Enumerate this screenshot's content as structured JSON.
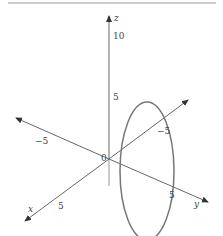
{
  "figure": {
    "type": "3d-axes-with-ellipse",
    "axes": {
      "z": {
        "label": "z",
        "ticks": [
          "10",
          "5"
        ]
      },
      "x": {
        "label": "x",
        "ticks": [
          "5",
          "−5"
        ]
      },
      "y": {
        "label": "y",
        "ticks": [
          "5",
          "−5"
        ]
      },
      "origin_label": "0"
    },
    "curve": {
      "shape": "ellipse",
      "plane": "vertical",
      "color": "#777777"
    },
    "colors": {
      "axis": "#666666",
      "rule": "#999999",
      "curve": "#777777"
    }
  }
}
